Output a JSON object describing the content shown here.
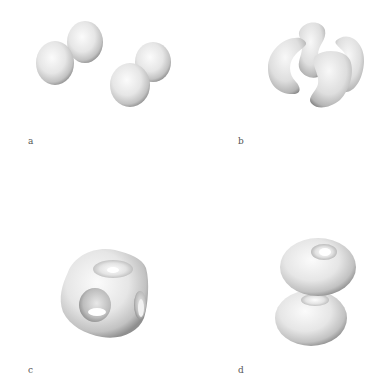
{
  "figure": {
    "panels": [
      {
        "id": "a",
        "label": "a",
        "description": "Two pairs of fused spherical lobes"
      },
      {
        "id": "b",
        "label": "b",
        "description": "Four kidney/crescent shaped lobes"
      },
      {
        "id": "c",
        "label": "c",
        "description": "Cube-like isosurface with holes in faces"
      },
      {
        "id": "d",
        "label": "d",
        "description": "Two stacked torus shaped lobes"
      }
    ]
  },
  "colors": {
    "background": "#ffffff",
    "surface_light": "#f7f7f7",
    "surface_mid": "#d4d4d4",
    "surface_dark": "#8a8a8a",
    "label": "#555555"
  }
}
